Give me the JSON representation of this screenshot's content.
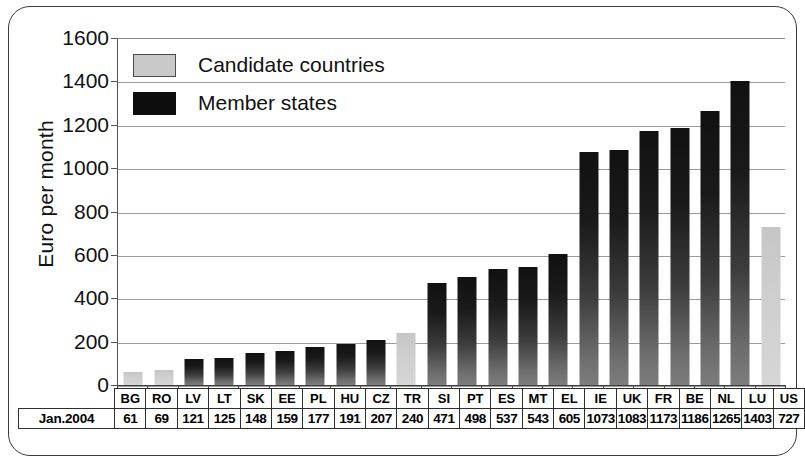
{
  "chart_data": {
    "type": "bar",
    "title": "",
    "subtitle": "",
    "xlabel": "",
    "ylabel": "Euro per month",
    "ylim": [
      0,
      1600
    ],
    "ytick_step": 200,
    "yticks": [
      "1600",
      "1400",
      "1200",
      "1000",
      "800",
      "600",
      "400",
      "200",
      "0"
    ],
    "grid": true,
    "legend_position": "top-left",
    "row_label": "Jan.2004",
    "categories": [
      "BG",
      "RO",
      "LV",
      "LT",
      "SK",
      "EE",
      "PL",
      "HU",
      "CZ",
      "TR",
      "SI",
      "PT",
      "ES",
      "MT",
      "EL",
      "IE",
      "UK",
      "FR",
      "BE",
      "NL",
      "LU",
      "US"
    ],
    "values": [
      61,
      69,
      121,
      125,
      148,
      159,
      177,
      191,
      207,
      240,
      471,
      498,
      537,
      543,
      605,
      1073,
      1083,
      1173,
      1186,
      1265,
      1403,
      727
    ],
    "groups": [
      "candidate",
      "candidate",
      "member",
      "member",
      "member",
      "member",
      "member",
      "member",
      "member",
      "candidate",
      "member",
      "member",
      "member",
      "member",
      "member",
      "member",
      "member",
      "member",
      "member",
      "member",
      "member",
      "candidate"
    ],
    "series": [
      {
        "name": "Candidate countries",
        "key": "candidate",
        "color": "#c9c9c9",
        "points": [
          {
            "category": "BG",
            "value": 61
          },
          {
            "category": "RO",
            "value": 69
          },
          {
            "category": "TR",
            "value": 240
          },
          {
            "category": "US",
            "value": 727
          }
        ]
      },
      {
        "name": "Member states",
        "key": "member",
        "color": "#0d0d0d",
        "points": [
          {
            "category": "LV",
            "value": 121
          },
          {
            "category": "LT",
            "value": 125
          },
          {
            "category": "SK",
            "value": 148
          },
          {
            "category": "EE",
            "value": 159
          },
          {
            "category": "PL",
            "value": 177
          },
          {
            "category": "HU",
            "value": 191
          },
          {
            "category": "CZ",
            "value": 207
          },
          {
            "category": "SI",
            "value": 471
          },
          {
            "category": "PT",
            "value": 498
          },
          {
            "category": "ES",
            "value": 537
          },
          {
            "category": "MT",
            "value": 543
          },
          {
            "category": "EL",
            "value": 605
          },
          {
            "category": "IE",
            "value": 1073
          },
          {
            "category": "UK",
            "value": 1083
          },
          {
            "category": "FR",
            "value": 1173
          },
          {
            "category": "BE",
            "value": 1186
          },
          {
            "category": "NL",
            "value": 1265
          },
          {
            "category": "LU",
            "value": 1403
          },
          {
            "category": "US",
            "value": 727
          }
        ]
      }
    ]
  },
  "legend": {
    "items": [
      {
        "label": "Candidate countries",
        "key": "candidate"
      },
      {
        "label": "Member states",
        "key": "member"
      }
    ]
  },
  "colors": {
    "member_bar_top": "#111111",
    "member_bar_bottom": "#7d7d7d",
    "candidate_bar": "#cfcfcf",
    "gridline": "#9b9b9b",
    "axis": "#3d3d3d",
    "frame": "#3a3a3a",
    "text": "#111111",
    "background": "#ffffff"
  }
}
